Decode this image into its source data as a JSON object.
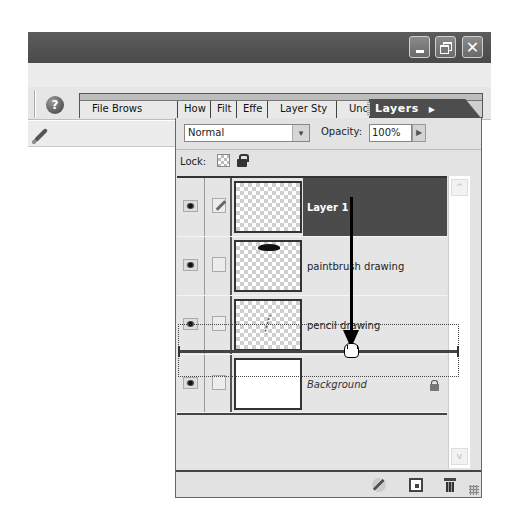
{
  "window": {
    "controls": [
      {
        "name": "minimize",
        "icon": "minimize-icon"
      },
      {
        "name": "restore",
        "icon": "restore-icon"
      },
      {
        "name": "close",
        "icon": "close-icon",
        "glyph": "✕"
      }
    ]
  },
  "options_bar": {
    "help_glyph": "?",
    "tool_icon": "paintbrush-icon"
  },
  "palette_well": {
    "tabs": [
      {
        "label": "File Brows"
      },
      {
        "label": "How"
      },
      {
        "label": "Filt"
      },
      {
        "label": "Effe"
      },
      {
        "label": "Layer Sty"
      },
      {
        "label": "Undo Histo"
      }
    ],
    "active_tab": {
      "label": "Layers",
      "menu_glyph": "▶"
    }
  },
  "layers_panel": {
    "blend_mode": "Normal",
    "blend_dropdown_glyph": "▾",
    "opacity_label": "Opacity:",
    "opacity_value": "100%",
    "opacity_arrow_glyph": "▶",
    "lock_label": "Lock:",
    "layers": [
      {
        "name": "Layer 1",
        "selected": true,
        "visible": true,
        "brush_linked": true,
        "thumbnail": "transparent"
      },
      {
        "name": "paintbrush drawing",
        "selected": false,
        "visible": true,
        "brush_linked": false,
        "thumbnail": "transparent-with-blob"
      },
      {
        "name": "pencil drawing",
        "selected": false,
        "visible": true,
        "brush_linked": false,
        "thumbnail": "transparent-with-scribble"
      },
      {
        "name": "Background",
        "selected": false,
        "visible": true,
        "brush_linked": false,
        "thumbnail": "white",
        "locked": true
      }
    ],
    "scroll_up_glyph": "^",
    "scroll_down_glyph": "v",
    "footer_icons": [
      "layer-style-icon",
      "new-layer-icon",
      "delete-layer-icon"
    ]
  },
  "annotation": {
    "drag_from": "Layer 1",
    "drop_between": [
      "pencil drawing",
      "Background"
    ]
  },
  "colors": {
    "titlebar": "#4f4f4f",
    "selected_layer": "#4b4b4b",
    "panel_bg": "#e3e3e3",
    "active_tab": "#4d4d4d"
  }
}
